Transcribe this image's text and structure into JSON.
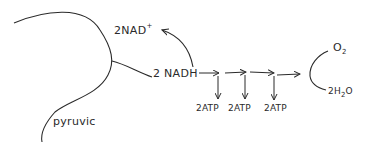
{
  "diagram": {
    "title": "",
    "labels": {
      "nad_plus": "2NAD",
      "nad_plus_sup": "+",
      "nadh": "2 NADH",
      "pyruvic": "pyruvic",
      "o2": "O",
      "o2_sub": "2",
      "water_prefix": "2H",
      "water_sub": "2",
      "water_suffix": "O",
      "atp": [
        "2ATP",
        "2ATP",
        "2ATP"
      ]
    },
    "colors": {
      "ink": "#2a2a2a",
      "background": "#ffffff"
    }
  }
}
